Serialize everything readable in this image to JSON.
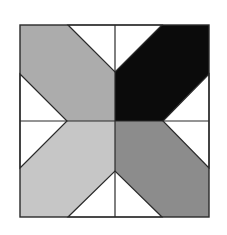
{
  "diagram": {
    "type": "quilt-block",
    "square": {
      "x": 20,
      "y": 25,
      "width": 189,
      "height": 192
    },
    "colors": {
      "top_left_arm": "#acacac",
      "top_right_arm": "#0b0b0b",
      "bottom_left_arm": "#c6c6c6",
      "bottom_right_arm": "#8c8c8c",
      "triangles": "#ffffff",
      "lines": "#2a2a2a"
    },
    "quadrants": [
      {
        "name": "top-left",
        "fill": "light-gray"
      },
      {
        "name": "top-right",
        "fill": "black"
      },
      {
        "name": "bottom-left",
        "fill": "lighter-gray"
      },
      {
        "name": "bottom-right",
        "fill": "medium-gray"
      }
    ],
    "triangles": [
      {
        "name": "top",
        "points": "68,25 162,25 115,72"
      },
      {
        "name": "bottom",
        "points": "68,217 162,217 115,171"
      },
      {
        "name": "left",
        "points": "20,74 20,168 67,121"
      },
      {
        "name": "right",
        "points": "209,74 209,168 163,121"
      }
    ]
  }
}
